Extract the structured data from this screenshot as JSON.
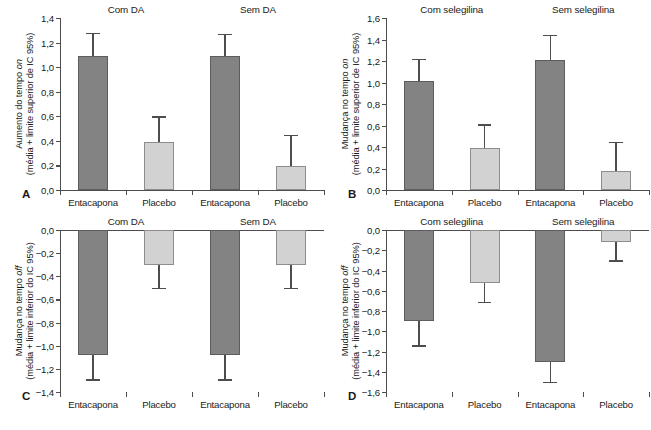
{
  "figure": {
    "panel_count": 4,
    "bar_colors": {
      "entacapona": "#838383",
      "placebo": "#d2d2d2"
    },
    "axis_color": "#4d4d4d"
  },
  "chart_data": [
    {
      "type": "bar",
      "panel": "A",
      "title": "",
      "ylabel_line1": "Aumento do tempo on",
      "ylabel_line2": "(média + limite superior de IC 95%)",
      "ylabel_italic_word": "on",
      "xlabel": "",
      "ylim": [
        0.0,
        1.4
      ],
      "ytick_labels": [
        "0,0",
        "0,2",
        "0,4",
        "0,6",
        "0,8",
        "1,0",
        "1,2",
        "1,4"
      ],
      "ytick_values": [
        0.0,
        0.2,
        0.4,
        0.6,
        0.8,
        1.0,
        1.2,
        1.4
      ],
      "grid": false,
      "legend": "none",
      "group_headers": [
        "Com DA",
        "Sem DA"
      ],
      "categories": [
        "Entacapona",
        "Placebo",
        "Entacapona",
        "Placebo"
      ],
      "values": [
        1.09,
        0.39,
        1.09,
        0.195
      ],
      "ci_upper": [
        1.28,
        0.6,
        1.27,
        0.45
      ],
      "bar_styles": [
        "dark",
        "light",
        "dark",
        "light"
      ]
    },
    {
      "type": "bar",
      "panel": "B",
      "title": "",
      "ylabel_line1": "Mudança no tempo on",
      "ylabel_line2": "(média + limite superior de IC 95%)",
      "ylabel_italic_word": "on",
      "xlabel": "",
      "ylim": [
        0.0,
        1.6
      ],
      "ytick_labels": [
        "0,0",
        "0,2",
        "0,4",
        "0,6",
        "0,8",
        "1,0",
        "1,2",
        "1,4",
        "1,6"
      ],
      "ytick_values": [
        0.0,
        0.2,
        0.4,
        0.6,
        0.8,
        1.0,
        1.2,
        1.4,
        1.6
      ],
      "grid": false,
      "legend": "none",
      "group_headers": [
        "Com selegilina",
        "Sem selegilina"
      ],
      "categories": [
        "Entacapona",
        "Placebo",
        "Entacapona",
        "Placebo"
      ],
      "values": [
        1.01,
        0.39,
        1.21,
        0.18
      ],
      "ci_upper": [
        1.22,
        0.61,
        1.44,
        0.45
      ],
      "bar_styles": [
        "dark",
        "light",
        "dark",
        "light"
      ]
    },
    {
      "type": "bar",
      "panel": "C",
      "title": "",
      "ylabel_line1": "Mudança no tempo off",
      "ylabel_line2": "(média + limite inferior do IC 95%)",
      "ylabel_italic_word": "off",
      "xlabel": "",
      "ylim": [
        -1.4,
        0.0
      ],
      "ytick_labels": [
        "0,0",
        "−0,2",
        "−0,4",
        "−0,6",
        "−0,8",
        "−1,0",
        "−1,2",
        "−1,4"
      ],
      "ytick_values": [
        0.0,
        -0.2,
        -0.4,
        -0.6,
        -0.8,
        -1.0,
        -1.2,
        -1.4
      ],
      "grid": false,
      "legend": "none",
      "group_headers": [
        "Com DA",
        "Sem DA"
      ],
      "categories": [
        "Entacapona",
        "Placebo",
        "Entacapona",
        "Placebo"
      ],
      "values": [
        -1.08,
        -0.3,
        -1.08,
        -0.3
      ],
      "ci_lower": [
        -1.29,
        -0.5,
        -1.29,
        -0.5
      ],
      "bar_styles": [
        "dark",
        "light",
        "dark",
        "light"
      ]
    },
    {
      "type": "bar",
      "panel": "D",
      "title": "",
      "ylabel_line1": "Mudança no tempo off",
      "ylabel_line2": "(média + limite inferior do IC 95%)",
      "ylabel_italic_word": "off",
      "xlabel": "",
      "ylim": [
        -1.6,
        0.0
      ],
      "ytick_labels": [
        "0,0",
        "−0,2",
        "−0,4",
        "−0,6",
        "−0,8",
        "−1,0",
        "−1,2",
        "−1,4",
        "−1,6"
      ],
      "ytick_values": [
        0.0,
        -0.2,
        -0.4,
        -0.6,
        -0.8,
        -1.0,
        -1.2,
        -1.4,
        -1.6
      ],
      "grid": false,
      "legend": "none",
      "group_headers": [
        "Com selegilina",
        "Sem selegilina"
      ],
      "categories": [
        "Entacapona",
        "Placebo",
        "Entacapona",
        "Placebo"
      ],
      "values": [
        -0.9,
        -0.52,
        -1.3,
        -0.12
      ],
      "ci_lower": [
        -1.14,
        -0.71,
        -1.5,
        -0.3
      ],
      "bar_styles": [
        "dark",
        "light",
        "dark",
        "light"
      ]
    }
  ],
  "panel_letters": [
    "A",
    "B",
    "C",
    "D"
  ]
}
